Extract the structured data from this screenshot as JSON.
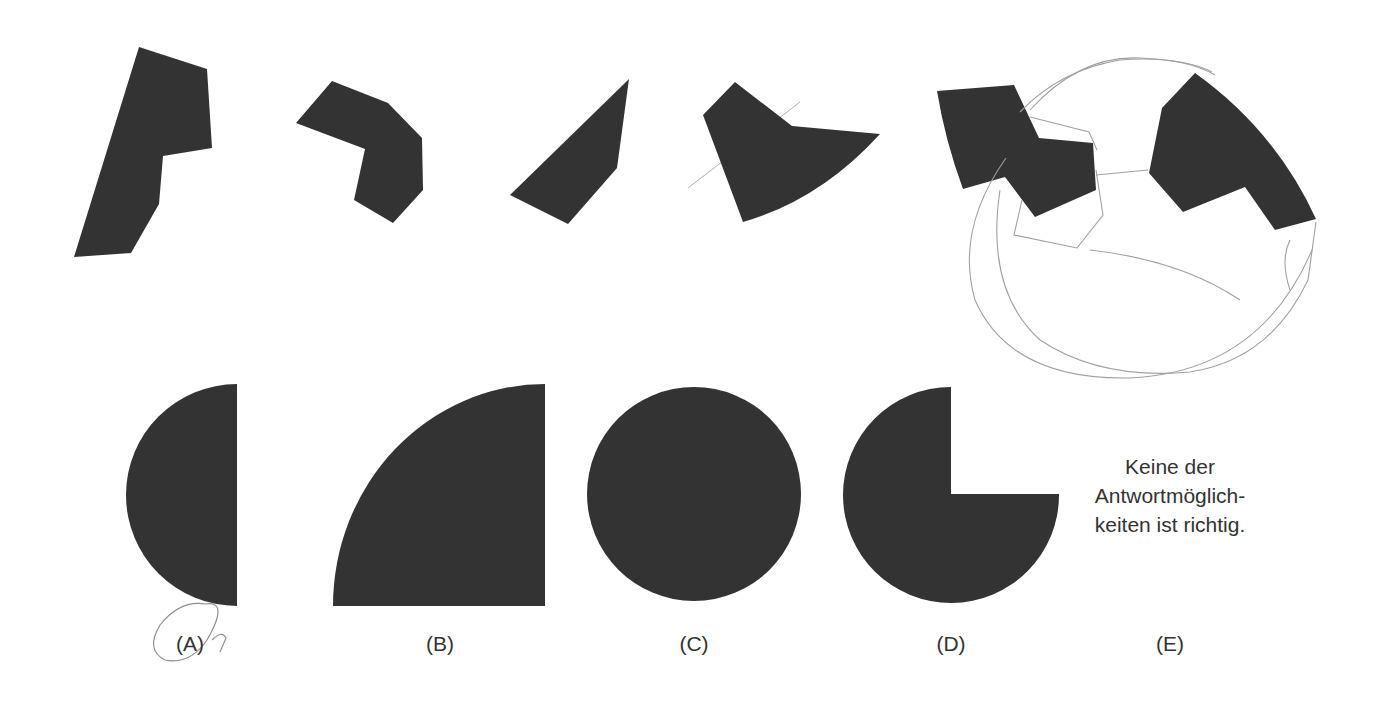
{
  "puzzle": {
    "type": "shape-assembly-question",
    "pieces_count": 5,
    "fill_color": "#333333",
    "pencil_color": "#9a9a9a"
  },
  "answers": [
    {
      "letter": "(A)",
      "shape": "half-disc",
      "marked_by_hand": true
    },
    {
      "letter": "(B)",
      "shape": "quarter-disc"
    },
    {
      "letter": "(C)",
      "shape": "full-disc"
    },
    {
      "letter": "(D)",
      "shape": "three-quarter-disc"
    },
    {
      "letter": "(E)",
      "shape": "text"
    }
  ],
  "option_e_text": {
    "line1": "Keine der",
    "line2": "Antwortmöglich-",
    "line3": "keiten ist richtig."
  }
}
